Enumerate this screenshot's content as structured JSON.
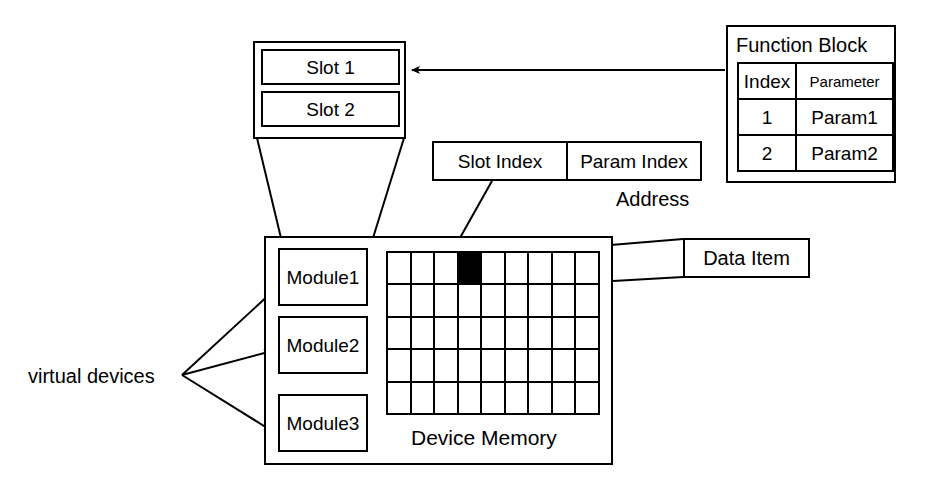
{
  "diagram": {
    "slot_container": {
      "name": "slot-container",
      "slots": [
        {
          "label": "Slot 1"
        },
        {
          "label": "Slot 2"
        }
      ]
    },
    "function_block": {
      "title": "Function Block",
      "columns": [
        "Index",
        "Parameter"
      ],
      "rows": [
        {
          "index": "1",
          "parameter": "Param1"
        },
        {
          "index": "2",
          "parameter": "Param2"
        }
      ]
    },
    "address": {
      "caption": "Address",
      "fields": [
        {
          "label": "Slot Index"
        },
        {
          "label": "Param Index"
        }
      ]
    },
    "device": {
      "modules": [
        {
          "label": "Module1"
        },
        {
          "label": "Module2"
        },
        {
          "label": "Module3"
        }
      ],
      "memory_caption": "Device Memory",
      "memory_grid": {
        "columns": 9,
        "rows": 5,
        "highlighted_cell": {
          "row": 1,
          "column": 4
        },
        "highlight_color": "#000000"
      }
    },
    "data_item": {
      "label": "Data Item"
    },
    "virtual_devices": {
      "label": "virtual devices"
    },
    "colors": {
      "stroke": "#000000",
      "background": "#ffffff",
      "fill": "#000000"
    }
  }
}
